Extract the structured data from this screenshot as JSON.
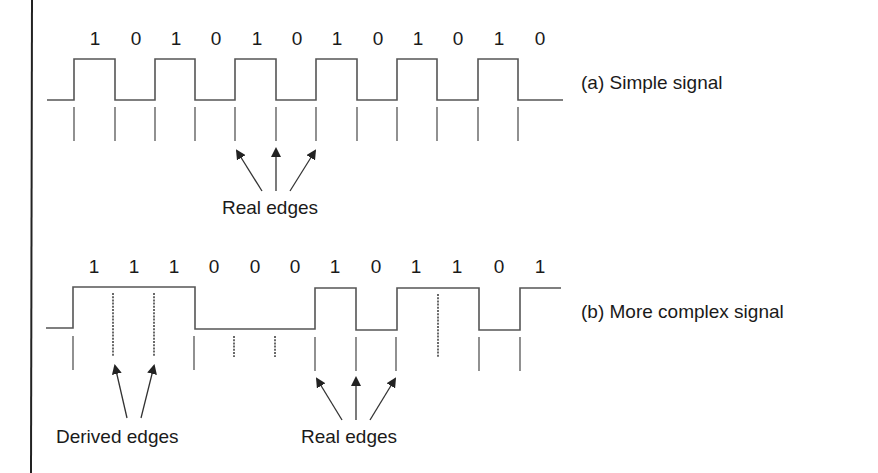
{
  "figure": {
    "panel_a": {
      "caption": "(a) Simple signal",
      "bits": [
        "1",
        "0",
        "1",
        "0",
        "1",
        "0",
        "1",
        "0",
        "1",
        "0",
        "1",
        "0"
      ],
      "annotation": "Real edges"
    },
    "panel_b": {
      "caption": "(b) More complex signal",
      "bits": [
        "1",
        "1",
        "1",
        "0",
        "0",
        "0",
        "1",
        "0",
        "1",
        "1",
        "0",
        "1"
      ],
      "annotation_derived": "Derived edges",
      "annotation_real": "Real edges"
    }
  },
  "colors": {
    "line": "#555555",
    "text": "#1a1a1a",
    "background": "#ffffff"
  }
}
